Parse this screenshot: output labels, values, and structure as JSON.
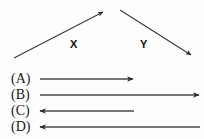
{
  "figure": {
    "background_color": "#fdfdfd",
    "stroke_color": "#3a3a3a",
    "text_color": "#1a1a1a"
  },
  "vectors": [
    {
      "name": "X",
      "label": "X",
      "direction": "up-right",
      "x1": 14,
      "y1": 58,
      "x2": 103,
      "y2": 12,
      "label_x": 70,
      "label_y": 39
    },
    {
      "name": "Y",
      "label": "Y",
      "direction": "down-right",
      "x1": 120,
      "y1": 10,
      "x2": 191,
      "y2": 55,
      "label_x": 140,
      "label_y": 39
    }
  ],
  "options": [
    {
      "label": "(A)",
      "label_x": 11,
      "label_y": 72,
      "arrow_direction": "right",
      "x1": 40,
      "y1": 79,
      "x2": 133,
      "y2": 79,
      "length": "short"
    },
    {
      "label": "(B)",
      "label_x": 11,
      "label_y": 88,
      "arrow_direction": "right",
      "x1": 40,
      "y1": 95,
      "x2": 199,
      "y2": 95,
      "length": "long"
    },
    {
      "label": "(C)",
      "label_x": 11,
      "label_y": 104,
      "arrow_direction": "left",
      "x1": 134,
      "y1": 111,
      "x2": 40,
      "y2": 111,
      "length": "short"
    },
    {
      "label": "(D)",
      "label_x": 11,
      "label_y": 120,
      "arrow_direction": "left",
      "x1": 200,
      "y1": 127,
      "x2": 40,
      "y2": 127,
      "length": "long"
    }
  ]
}
